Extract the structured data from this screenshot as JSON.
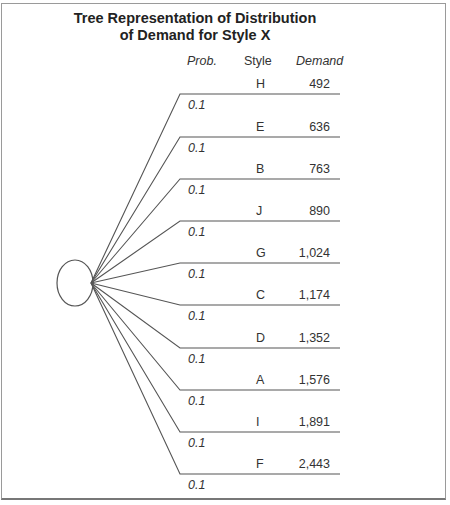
{
  "title": {
    "line1": "Tree Representation of Distribution",
    "line2": "of Demand for Style X"
  },
  "headers": {
    "prob": "Prob.",
    "style": "Style",
    "demand": "Demand"
  },
  "branches": [
    {
      "style": "H",
      "demand": "492",
      "prob": "0.1"
    },
    {
      "style": "E",
      "demand": "636",
      "prob": "0.1"
    },
    {
      "style": "B",
      "demand": "763",
      "prob": "0.1"
    },
    {
      "style": "J",
      "demand": "890",
      "prob": "0.1"
    },
    {
      "style": "G",
      "demand": "1,024",
      "prob": "0.1"
    },
    {
      "style": "C",
      "demand": "1,174",
      "prob": "0.1"
    },
    {
      "style": "D",
      "demand": "1,352",
      "prob": "0.1"
    },
    {
      "style": "A",
      "demand": "1,576",
      "prob": "0.1"
    },
    {
      "style": "I",
      "demand": "1,891",
      "prob": "0.1"
    },
    {
      "style": "F",
      "demand": "2,443",
      "prob": "0.1"
    }
  ],
  "chart_data": {
    "type": "table",
    "title": "Tree Representation of Distribution of Demand for Style X",
    "columns": [
      "Prob.",
      "Style",
      "Demand"
    ],
    "rows": [
      [
        0.1,
        "H",
        492
      ],
      [
        0.1,
        "E",
        636
      ],
      [
        0.1,
        "B",
        763
      ],
      [
        0.1,
        "J",
        890
      ],
      [
        0.1,
        "G",
        1024
      ],
      [
        0.1,
        "C",
        1174
      ],
      [
        0.1,
        "D",
        1352
      ],
      [
        0.1,
        "A",
        1576
      ],
      [
        0.1,
        "I",
        1891
      ],
      [
        0.1,
        "F",
        2443
      ]
    ]
  }
}
